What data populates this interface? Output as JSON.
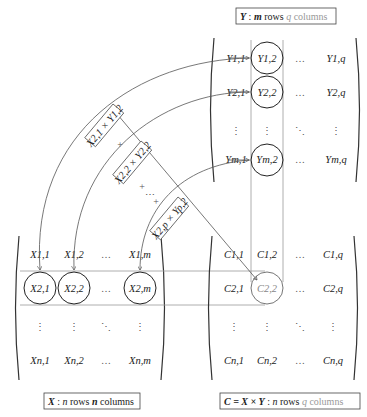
{
  "captions": {
    "y_matrix": {
      "var": "Y",
      "sep": " : ",
      "rows_var": "m",
      "rows_word": " rows ",
      "cols_var": "q",
      "cols_word": " columns"
    },
    "x_matrix": {
      "var": "X",
      "sep": " : ",
      "rows_var": "n",
      "rows_word": " rows ",
      "cols_var": "m",
      "cols_word": " columns"
    },
    "c_matrix": {
      "var": "C = X × Y",
      "sep": " : ",
      "rows_var": "n",
      "rows_word": " rows ",
      "cols_var": "q",
      "cols_word": " columns"
    }
  },
  "matrix_y": {
    "rows": [
      [
        "Y1,1",
        "Y1,2",
        "…",
        "Y1,q"
      ],
      [
        "Y2,1",
        "Y2,2",
        "…",
        "Y2,q"
      ],
      [
        "⋮",
        "⋮",
        "⋱",
        "⋮"
      ],
      [
        "Ym,1",
        "Ym,2",
        "…",
        "Ym,q"
      ]
    ],
    "highlighted_column": 2
  },
  "matrix_x": {
    "rows": [
      [
        "X1,1",
        "X1,2",
        "…",
        "X1,m"
      ],
      [
        "X2,1",
        "X2,2",
        "…",
        "X2,m"
      ],
      [
        "⋮",
        "⋮",
        "⋱",
        "⋮"
      ],
      [
        "Xn,1",
        "Xn,2",
        "…",
        "Xn,m"
      ]
    ],
    "highlighted_row": 2
  },
  "matrix_c": {
    "rows": [
      [
        "C1,1",
        "C1,2",
        "…",
        "C1,q"
      ],
      [
        "C2,1",
        "C2,2",
        "…",
        "C2,q"
      ],
      [
        "⋮",
        "⋮",
        "⋱",
        "⋮"
      ],
      [
        "Cn,1",
        "Cn,2",
        "…",
        "Cn,q"
      ]
    ],
    "highlighted_cell": "C2,2"
  },
  "products": [
    {
      "label": "X2,1 × Y1,2"
    },
    {
      "label": "X2,2 × Y2,2"
    },
    {
      "label": "X2,p × Yp,2"
    }
  ],
  "plus_signs": [
    "+",
    "+",
    "+"
  ],
  "ellipsis": "⋯"
}
